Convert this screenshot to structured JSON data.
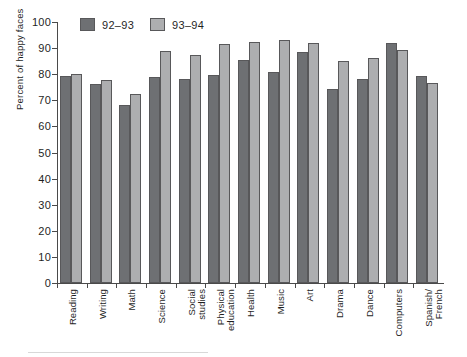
{
  "chart_data": {
    "type": "bar",
    "title": "",
    "xlabel": "",
    "ylabel": "Percent of happy faces",
    "ylim": [
      0,
      100
    ],
    "ytick_step": 10,
    "yticks": [
      0,
      10,
      20,
      30,
      40,
      50,
      60,
      70,
      80,
      90,
      100
    ],
    "ytick_labels": [
      "0",
      "10",
      "20",
      "30",
      "40",
      "50",
      "60",
      "70",
      "80",
      "90",
      "100"
    ],
    "grid": false,
    "legend_position": "top-left",
    "categories": [
      "Reading",
      "Writing",
      "Math",
      "Science",
      "Social\nstudies",
      "Physical\neducation",
      "Health",
      "Music",
      "Art",
      "Drama",
      "Dance",
      "Computers",
      "Spanish/\nFrench"
    ],
    "series": [
      {
        "name": "92-93",
        "color": "#6e7073",
        "values": [
          79.4,
          76.1,
          68.1,
          79.0,
          78.1,
          79.7,
          85.4,
          81.0,
          88.6,
          74.5,
          78.2,
          91.9,
          79.3
        ]
      },
      {
        "name": "93-94",
        "color": "#adaeb0",
        "values": [
          80.0,
          77.7,
          72.6,
          88.8,
          87.3,
          91.7,
          92.2,
          93.3,
          91.8,
          85.2,
          86.2,
          89.3,
          76.6
        ]
      }
    ]
  },
  "legend": {
    "items": [
      {
        "label": "92–93",
        "swatch": "dark-gray-swatch"
      },
      {
        "label": "93–94",
        "swatch": "light-gray-swatch"
      }
    ]
  },
  "axes": {
    "y_title": "Percent of happy faces"
  }
}
